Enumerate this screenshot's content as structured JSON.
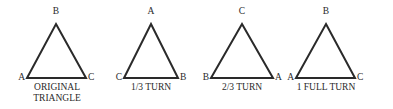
{
  "figure": {
    "name": "rotational-symmetry-triangle-series",
    "stroke_color": "#2a2a2a",
    "background_color": "#ffffff",
    "figures": [
      {
        "caption": "ORIGINAL\nTRIANGLE",
        "apex_label": "B",
        "left_label": "A",
        "right_label": "C"
      },
      {
        "caption": "1/3 TURN",
        "apex_label": "A",
        "left_label": "C",
        "right_label": "B"
      },
      {
        "caption": "2/3 TURN",
        "apex_label": "C",
        "left_label": "B",
        "right_label": "A"
      },
      {
        "caption": "1 FULL TURN",
        "apex_label": "B",
        "left_label": "A",
        "right_label": "C"
      }
    ]
  }
}
